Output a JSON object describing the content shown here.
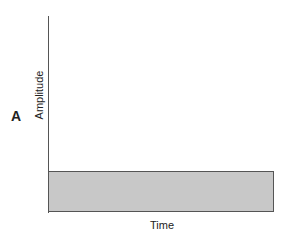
{
  "panel_label": "A",
  "chart_data": {
    "type": "area",
    "title": "",
    "xlabel": "Time",
    "ylabel": "Amplitude",
    "series": [
      {
        "name": "amplitude",
        "description": "constant flat level across time",
        "values": [
          1,
          1
        ]
      }
    ],
    "x": [
      "start",
      "end"
    ],
    "grid": false,
    "legend": null
  }
}
